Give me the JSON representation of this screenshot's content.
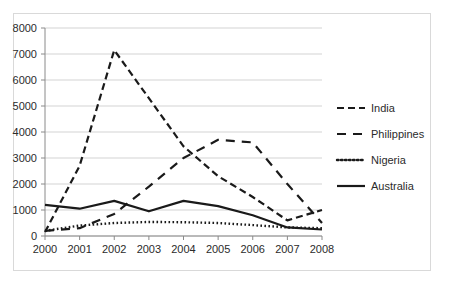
{
  "chart_data": {
    "type": "line",
    "title": "",
    "xlabel": "",
    "ylabel": "",
    "x": [
      2000,
      2001,
      2002,
      2003,
      2004,
      2005,
      2006,
      2007,
      2008
    ],
    "categories": [
      "2000",
      "2001",
      "2002",
      "2003",
      "2004",
      "2005",
      "2006",
      "2007",
      "2008"
    ],
    "ylim": [
      0,
      8000
    ],
    "yticks": [
      0,
      1000,
      2000,
      3000,
      4000,
      5000,
      6000,
      7000,
      8000
    ],
    "ytick_labels": [
      "0",
      "1000",
      "2000",
      "3000",
      "4000",
      "5000",
      "6000",
      "7000",
      "8000"
    ],
    "grid": "horizontal",
    "legend_position": "right",
    "series": [
      {
        "name": "India",
        "style": "dashed",
        "color": "#1a1a1a",
        "values": [
          150,
          2700,
          7150,
          5300,
          3450,
          2300,
          1500,
          600,
          1000
        ]
      },
      {
        "name": "Philippines",
        "style": "long-dashed",
        "color": "#1a1a1a",
        "values": [
          200,
          300,
          850,
          1900,
          3000,
          3700,
          3600,
          2000,
          500
        ]
      },
      {
        "name": "Nigeria",
        "style": "dotted",
        "color": "#1a1a1a",
        "values": [
          200,
          400,
          500,
          540,
          530,
          500,
          420,
          330,
          300
        ]
      },
      {
        "name": "Australia",
        "style": "solid",
        "color": "#1a1a1a",
        "values": [
          1200,
          1050,
          1350,
          950,
          1350,
          1150,
          800,
          330,
          250
        ]
      }
    ]
  },
  "axis": {
    "y_tick_labels": [
      "8000",
      "7000",
      "6000",
      "5000",
      "4000",
      "3000",
      "2000",
      "1000",
      "0"
    ],
    "x_tick_labels": [
      "2000",
      "2001",
      "2002",
      "2003",
      "2004",
      "2005",
      "2006",
      "2007",
      "2008"
    ]
  },
  "legend": {
    "entries": [
      {
        "label": "India",
        "style": "dashed"
      },
      {
        "label": "Philippines",
        "style": "long-dashed"
      },
      {
        "label": "Nigeria",
        "style": "dotted"
      },
      {
        "label": "Australia",
        "style": "solid"
      }
    ]
  },
  "colors": {
    "line": "#1a1a1a",
    "grid": "#c8c8c8",
    "axis": "#8a8a8a",
    "frame": "#d9d9d9",
    "text": "#2b2b2b",
    "background": "#ffffff"
  }
}
